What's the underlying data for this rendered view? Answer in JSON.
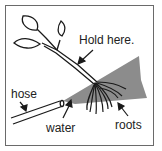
{
  "diagram": {
    "labels": {
      "hold_here": "Hold here.",
      "hose": "hose",
      "water": "water",
      "roots": "roots"
    },
    "colors": {
      "line": "#1a1a1a",
      "water_spray": "#8c8c8c",
      "frame": "#6a6a6a",
      "background": "#ffffff"
    }
  }
}
